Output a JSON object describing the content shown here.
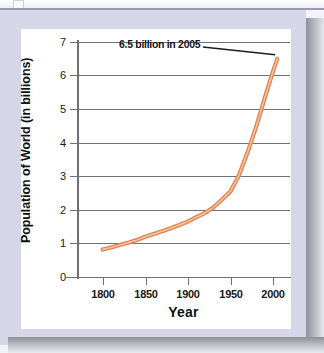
{
  "card": {
    "frame_color": "#d5d7e8",
    "background_color": "#ffffff",
    "shadow_color": "#8e9099"
  },
  "chart_data": {
    "type": "line",
    "title": "",
    "subtitle": "",
    "xlabel": "Year",
    "ylabel": "Population of World (in billions)",
    "xlim": [
      1770,
      2020
    ],
    "ylim": [
      0,
      7
    ],
    "grid": true,
    "legend": "none",
    "line_color": "#e0834f",
    "line_highlight_color": "#f7c8a8",
    "axis_color": "#6f7176",
    "x_ticks": [
      1800,
      1850,
      1900,
      1950,
      2000
    ],
    "x_tick_labels": [
      "1800",
      "1850",
      "1900",
      "1950",
      "2000"
    ],
    "y_ticks": [
      0,
      1,
      2,
      3,
      4,
      5,
      6,
      7
    ],
    "y_tick_labels": [
      "0",
      "1",
      "2",
      "3",
      "4",
      "5",
      "6",
      "7"
    ],
    "series": [
      {
        "name": "World population",
        "x": [
          1800,
          1810,
          1820,
          1830,
          1840,
          1850,
          1860,
          1870,
          1880,
          1890,
          1900,
          1910,
          1920,
          1930,
          1940,
          1950,
          1960,
          1970,
          1980,
          1990,
          2000,
          2005
        ],
        "values": [
          0.82,
          0.88,
          0.95,
          1.02,
          1.1,
          1.2,
          1.28,
          1.36,
          1.45,
          1.55,
          1.65,
          1.78,
          1.9,
          2.07,
          2.3,
          2.55,
          3.02,
          3.7,
          4.45,
          5.3,
          6.12,
          6.5
        ]
      }
    ],
    "annotations": [
      {
        "text": "6.5 billion in 2005",
        "points_to_x": 2005,
        "points_to_y": 6.5,
        "leader_line_color": "#1d1d20"
      }
    ]
  },
  "accessibility": {
    "figure_description": "Line graph showing exponential growth of world population in billions from 1800 to 2005."
  }
}
